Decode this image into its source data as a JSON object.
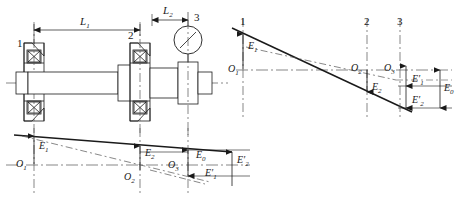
{
  "figure": {
    "colors": {
      "line": "#1a1a1a",
      "thin": "#555555",
      "centerline": "#666666",
      "background": "#ffffff"
    }
  },
  "assembly": {
    "name": "shaft-bearing-assembly",
    "callouts": [
      {
        "id": "callout-1",
        "text": "1"
      },
      {
        "id": "callout-2",
        "text": "2"
      },
      {
        "id": "callout-3",
        "text": "3"
      }
    ],
    "dimensions": [
      {
        "id": "dim-L1",
        "symbol": "L",
        "subscript": "1"
      },
      {
        "id": "dim-L2",
        "symbol": "L",
        "subscript": "2"
      }
    ],
    "parts": {
      "bearing_left": "bearing-1",
      "bearing_right": "bearing-2",
      "dial_indicator": "dial-indicator-3",
      "shaft": "shaft"
    }
  },
  "diagram_top": {
    "name": "axis-deviation-diagram-top-right",
    "station_labels": [
      "1",
      "2",
      "3"
    ],
    "origins": [
      {
        "symbol": "O",
        "subscript": "1"
      },
      {
        "symbol": "O",
        "subscript": "2"
      },
      {
        "symbol": "O",
        "subscript": "3"
      }
    ],
    "errors": [
      {
        "symbol": "E",
        "subscript": "1",
        "prime": false
      },
      {
        "symbol": "E",
        "subscript": "2",
        "prime": false
      },
      {
        "symbol": "E",
        "subscript": "1",
        "prime": true
      },
      {
        "symbol": "E",
        "subscript": "2",
        "prime": true
      },
      {
        "symbol": "E",
        "subscript": "0",
        "prime": false
      }
    ]
  },
  "diagram_bottom": {
    "name": "axis-deviation-diagram-bottom-left",
    "origins": [
      {
        "symbol": "O",
        "subscript": "1"
      },
      {
        "symbol": "O",
        "subscript": "2"
      },
      {
        "symbol": "O",
        "subscript": "3"
      }
    ],
    "errors": [
      {
        "symbol": "E",
        "subscript": "1",
        "prime": false
      },
      {
        "symbol": "E",
        "subscript": "2",
        "prime": false
      },
      {
        "symbol": "E",
        "subscript": "0",
        "prime": false
      },
      {
        "symbol": "E",
        "subscript": "1",
        "prime": true
      },
      {
        "symbol": "E",
        "subscript": "2",
        "prime": true
      }
    ]
  },
  "labels": {
    "n1": "1",
    "n2": "2",
    "n3": "3",
    "L1_base": "L",
    "L1_sub": "1",
    "L2_base": "L",
    "L2_sub": "2",
    "O_base": "O",
    "O1_sub": "1",
    "O2_sub": "2",
    "O3_sub": "3",
    "E_base": "E",
    "E0_sub": "0",
    "E1_sub": "1",
    "E2_sub": "2",
    "prime": "′"
  }
}
